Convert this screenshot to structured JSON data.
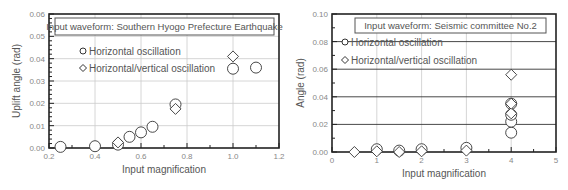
{
  "chart_data": [
    {
      "type": "scatter",
      "title": "Input waveform: Southern Hyogo Prefecture Earthquake",
      "xlabel": "Input magnification",
      "ylabel": "Uplift angle (rad)",
      "xlim": [
        0.2,
        1.2
      ],
      "ylim": [
        0,
        0.06
      ],
      "xticks": [
        "0.2",
        "0.4",
        "0.6",
        "0.8",
        "1.0",
        "1.2"
      ],
      "yticks": [
        "0.00",
        "0.01",
        "0.02",
        "0.03",
        "0.04",
        "0.05",
        "0.06"
      ],
      "grid": true,
      "legend_position": "upper-left-inside",
      "series": [
        {
          "name": "Horizontal oscillation",
          "marker": "circle",
          "points": [
            [
              0.25,
              0.0005
            ],
            [
              0.4,
              0.0008
            ],
            [
              0.5,
              0.0015
            ],
            [
              0.55,
              0.005
            ],
            [
              0.6,
              0.007
            ],
            [
              0.65,
              0.0095
            ],
            [
              0.75,
              0.0195
            ],
            [
              1.0,
              0.0355
            ],
            [
              1.1,
              0.036
            ]
          ]
        },
        {
          "name": "Horizontal/vertical oscillation",
          "marker": "diamond",
          "points": [
            [
              0.5,
              0.0025
            ],
            [
              0.75,
              0.0175
            ],
            [
              1.0,
              0.041
            ]
          ]
        }
      ]
    },
    {
      "type": "scatter",
      "title": "Input waveform: Seismic committee No.2",
      "xlabel": "Input magnification",
      "ylabel": "Angle (rad)",
      "xlim": [
        0,
        5
      ],
      "ylim": [
        0,
        0.1
      ],
      "xticks": [
        "0",
        "1",
        "2",
        "3",
        "4",
        "5"
      ],
      "yticks": [
        "0.00",
        "0.02",
        "0.04",
        "0.06",
        "0.08",
        "0.10"
      ],
      "grid": true,
      "legend_position": "upper-left-inside",
      "series": [
        {
          "name": "Horizontal oscillation",
          "marker": "circle",
          "points": [
            [
              1.0,
              0.002
            ],
            [
              1.5,
              0.001
            ],
            [
              2.0,
              0.002
            ],
            [
              3.0,
              0.003
            ],
            [
              4.0,
              0.014
            ],
            [
              4.0,
              0.022
            ],
            [
              4.0,
              0.027
            ],
            [
              4.0,
              0.035
            ]
          ]
        },
        {
          "name": "Horizontal/vertical oscillation",
          "marker": "diamond",
          "points": [
            [
              0.5,
              0.0
            ],
            [
              1.0,
              0.0005
            ],
            [
              1.5,
              0.0
            ],
            [
              2.0,
              0.0005
            ],
            [
              3.0,
              0.001
            ],
            [
              4.0,
              0.028
            ],
            [
              4.0,
              0.035
            ],
            [
              4.0,
              0.056
            ]
          ]
        }
      ]
    }
  ],
  "charts": {
    "left": {
      "title": "Input waveform: Southern Hyogo Prefecture Earthquake",
      "xlabel": "Input magnification",
      "ylabel": "Uplift angle (rad)",
      "legend": [
        "Horizontal oscillation",
        "Horizontal/vertical oscillation"
      ]
    },
    "right": {
      "title": "Input waveform: Seismic committee No.2",
      "xlabel": "Input magnification",
      "ylabel": "Angle (rad)",
      "legend": [
        "Horizontal oscillation",
        "Horizontal/vertical oscillation"
      ]
    }
  },
  "colors": {
    "axis": "#222222",
    "grid": "#cccccc",
    "text": "#555555",
    "marker_stroke": "#333333",
    "marker_fill": "#ffffff"
  }
}
